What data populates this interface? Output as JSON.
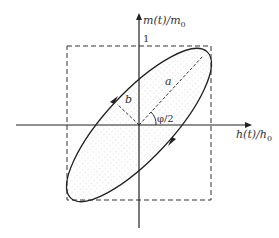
{
  "diagram": {
    "type": "tilted ellipse in normalized m-h plane (hysteresis loop)",
    "y_axis_label": "m(t)/m",
    "y_axis_sub": "0",
    "x_axis_label": "h(t)/h",
    "x_axis_sub": "0",
    "tick_label_top": "1",
    "semi_major_label": "a",
    "semi_minor_label": "b",
    "angle_label": "φ/2",
    "colors": {
      "line": "#222222",
      "fill_dots": "#b0b0b0",
      "background": "#ffffff"
    },
    "elements": [
      "horizontal axis with arrow",
      "vertical axis with arrow",
      "dashed unit square",
      "ellipse rotated 45 degrees with dotted fill",
      "dashed semi-major axis a",
      "dashed semi-minor axis b",
      "angle arc phi/2",
      "two direction arrows on ellipse"
    ]
  }
}
